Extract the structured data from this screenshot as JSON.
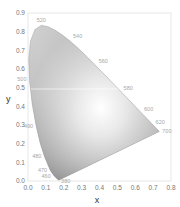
{
  "chart_data": {
    "type": "scatter",
    "title": "",
    "subtitle": "CIE 1931 chromaticity diagram (grayscale)",
    "xlabel": "x",
    "ylabel": "y",
    "xlim": [
      0.0,
      0.8
    ],
    "ylim": [
      0.0,
      0.9
    ],
    "grid": false,
    "legend": null,
    "x_ticks": [
      "0.0",
      "0.1",
      "0.2",
      "0.3",
      "0.4",
      "0.5",
      "0.6",
      "0.7",
      "0.8"
    ],
    "y_ticks": [
      "0.0",
      "0.1",
      "0.2",
      "0.3",
      "0.4",
      "0.5",
      "0.6",
      "0.7",
      "0.8",
      "0.9"
    ],
    "spectral_locus": {
      "x": [
        0.1741,
        0.1733,
        0.1726,
        0.1714,
        0.1689,
        0.1644,
        0.1566,
        0.144,
        0.1241,
        0.0913,
        0.0687,
        0.0454,
        0.0235,
        0.0082,
        0.0039,
        0.0139,
        0.0389,
        0.0743,
        0.1142,
        0.1547,
        0.1929,
        0.2296,
        0.2658,
        0.3016,
        0.3373,
        0.3731,
        0.4087,
        0.4441,
        0.4788,
        0.5125,
        0.5448,
        0.5752,
        0.6029,
        0.627,
        0.6482,
        0.6658,
        0.6801,
        0.6915,
        0.7006,
        0.7079,
        0.714,
        0.719,
        0.723,
        0.726,
        0.7283,
        0.73,
        0.7347
      ],
      "y": [
        0.005,
        0.0048,
        0.0048,
        0.0051,
        0.0069,
        0.0109,
        0.0177,
        0.0297,
        0.0578,
        0.1327,
        0.2007,
        0.295,
        0.4127,
        0.5384,
        0.6548,
        0.7502,
        0.812,
        0.8338,
        0.8262,
        0.8059,
        0.7816,
        0.7543,
        0.7243,
        0.6923,
        0.6589,
        0.6245,
        0.5896,
        0.5547,
        0.5202,
        0.4866,
        0.4544,
        0.4242,
        0.3965,
        0.3725,
        0.3514,
        0.334,
        0.3197,
        0.3083,
        0.2993,
        0.292,
        0.2859,
        0.2809,
        0.277,
        0.274,
        0.2717,
        0.27,
        0.2653
      ]
    },
    "wavelength_labels": [
      {
        "label": "520",
        "x": 0.0743,
        "y": 0.8338
      },
      {
        "label": "540",
        "x": 0.2296,
        "y": 0.7543
      },
      {
        "label": "560",
        "x": 0.3731,
        "y": 0.6245
      },
      {
        "label": "580",
        "x": 0.5125,
        "y": 0.4866
      },
      {
        "label": "600",
        "x": 0.627,
        "y": 0.3725
      },
      {
        "label": "620",
        "x": 0.6915,
        "y": 0.3083
      },
      {
        "label": "700",
        "x": 0.7347,
        "y": 0.2653
      },
      {
        "label": "500",
        "x": 0.0082,
        "y": 0.5384
      },
      {
        "label": "490",
        "x": 0.0454,
        "y": 0.295
      },
      {
        "label": "480",
        "x": 0.0913,
        "y": 0.1327
      },
      {
        "label": "470",
        "x": 0.1241,
        "y": 0.0578
      },
      {
        "label": "460",
        "x": 0.144,
        "y": 0.0297
      },
      {
        "label": "380",
        "x": 0.1741,
        "y": 0.005
      }
    ],
    "colors": {
      "axis": "#cccccc",
      "tick_text": "#777777",
      "wavelength_text": "#a8a8a8",
      "locus_fill_light": "#f4f4f4",
      "locus_fill_mid": "#bdbdbd",
      "locus_fill_dark": "#4a4a4a"
    }
  }
}
